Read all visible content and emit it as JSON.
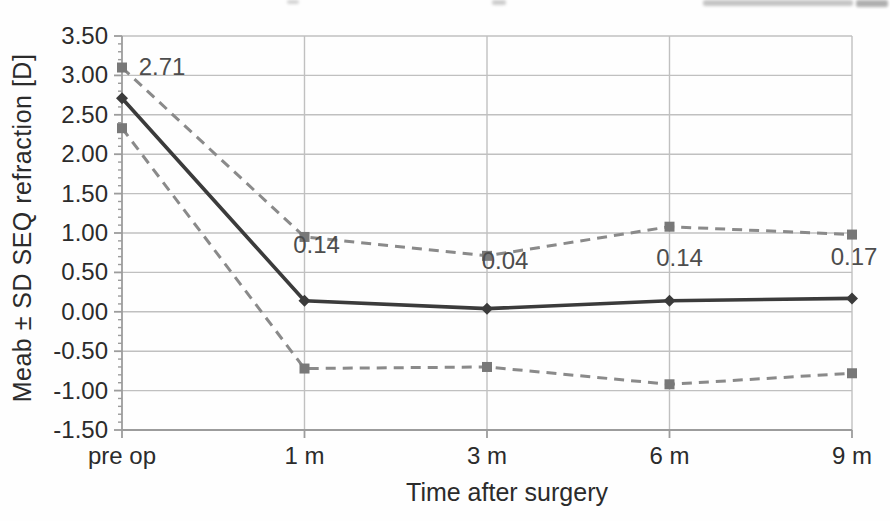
{
  "figure": {
    "colors": {
      "mean_line": "#3b3b3b",
      "sd_line": "#8a8a8a",
      "sd_marker": "#787878",
      "gridline": "#c0c0c0",
      "axis_line": "#9c9c9c",
      "axis_text": "#2b2b2b",
      "data_label_text": "#4d4d4d",
      "background": "#fefefe"
    }
  },
  "chart_data": {
    "type": "line",
    "title": "",
    "xlabel": "Time after surgery",
    "ylabel": "Meab ± SD SEQ refraction [D]",
    "categories": [
      "pre op",
      "1 m",
      "3 m",
      "6 m",
      "9 m"
    ],
    "series": [
      {
        "name": "mean",
        "style": "solid",
        "marker": "diamond",
        "values": [
          2.71,
          0.14,
          0.04,
          0.14,
          0.17
        ]
      },
      {
        "name": "mean-plus-sd",
        "style": "dashed",
        "marker": "square",
        "values": [
          3.1,
          0.95,
          0.71,
          1.08,
          0.98
        ]
      },
      {
        "name": "mean-minus-sd",
        "style": "dashed",
        "marker": "square",
        "values": [
          2.33,
          -0.72,
          -0.7,
          -0.92,
          -0.78
        ]
      }
    ],
    "data_labels": [
      "2.71",
      "0.14",
      "0.04",
      "0.14",
      "0.17"
    ],
    "ylim": [
      -1.5,
      3.5
    ],
    "ytick_step": 0.5,
    "ytick_labels": [
      "3.50",
      "3.00",
      "2.50",
      "2.00",
      "1.50",
      "1.00",
      "0.50",
      "0.00",
      "-0.50",
      "-1.00",
      "-1.50"
    ],
    "minor_tick_step": 0.1,
    "grid": true,
    "legend": "none"
  }
}
